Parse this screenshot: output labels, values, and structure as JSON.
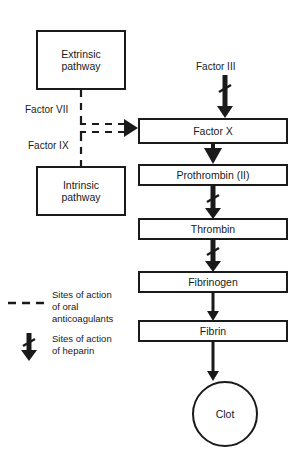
{
  "diagram": {
    "colors": {
      "stroke": "#1a1a1a",
      "background": "#ffffff",
      "text": "#1a1a1a"
    },
    "pathway_boxes": [
      {
        "id": "extrinsic",
        "label": "Extrinsic\npathway",
        "x": 36,
        "y": 30,
        "w": 90,
        "h": 60
      },
      {
        "id": "intrinsic",
        "label": "Intrinsic\npathway",
        "x": 36,
        "y": 166,
        "w": 90,
        "h": 50
      }
    ],
    "step_boxes": [
      {
        "id": "factor-x",
        "label": "Factor X",
        "x": 138,
        "y": 118,
        "w": 150,
        "h": 26
      },
      {
        "id": "prothrombin",
        "label": "Prothrombin (II)",
        "x": 138,
        "y": 164,
        "w": 150,
        "h": 22
      },
      {
        "id": "thrombin",
        "label": "Thrombin",
        "x": 138,
        "y": 218,
        "w": 150,
        "h": 22
      },
      {
        "id": "fibrinogen",
        "label": "Fibrinogen",
        "x": 138,
        "y": 271,
        "w": 150,
        "h": 22
      },
      {
        "id": "fibrin",
        "label": "Fibrin",
        "x": 138,
        "y": 320,
        "w": 150,
        "h": 22
      }
    ],
    "clot": {
      "id": "clot",
      "label": "Clot",
      "cx": 225,
      "cy": 414,
      "r": 33
    },
    "free_labels": [
      {
        "id": "factor-iii",
        "text": "Factor III",
        "x": 196,
        "y": 61
      },
      {
        "id": "factor-vii",
        "text": "Factor VII",
        "x": 25,
        "y": 104
      },
      {
        "id": "factor-ix",
        "text": "Factor IX",
        "x": 28,
        "y": 140
      }
    ],
    "legend": [
      {
        "id": "oral-anticoagulants",
        "marker": "dashed-line",
        "text": "Sites of action\nof oral\nanticoagulants",
        "text_x": 52,
        "text_y": 289
      },
      {
        "id": "heparin",
        "marker": "barbed-arrow",
        "text": "Sites of action\nof heparin",
        "text_x": 52,
        "text_y": 333
      }
    ],
    "connectors": [
      {
        "id": "factor-iii-to-factor-x",
        "style": "barbed-arrow"
      },
      {
        "id": "extrinsic-to-factor-x",
        "style": "dashed-arrow"
      },
      {
        "id": "intrinsic-to-factor-x",
        "style": "dashed-arrow"
      },
      {
        "id": "factor-x-to-prothrombin",
        "style": "solid-arrow"
      },
      {
        "id": "prothrombin-to-thrombin",
        "style": "barbed-arrow"
      },
      {
        "id": "thrombin-to-fibrinogen",
        "style": "barbed-arrow"
      },
      {
        "id": "fibrinogen-to-fibrin",
        "style": "thin-arrow"
      },
      {
        "id": "fibrin-to-clot",
        "style": "thin-arrow"
      }
    ]
  }
}
